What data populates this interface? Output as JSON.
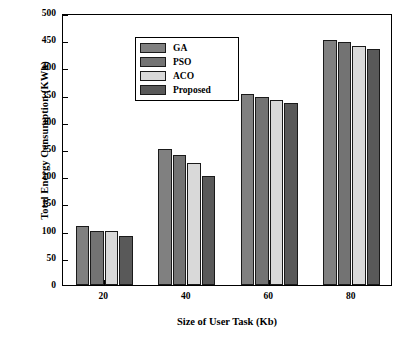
{
  "chart_data": {
    "type": "bar",
    "title": "",
    "xlabel": "Size of User Task (Kb)",
    "ylabel": "Total Energy Consumption (KWh)",
    "categories": [
      "20",
      "40",
      "60",
      "80"
    ],
    "series": [
      {
        "name": "GA",
        "color": "#808080",
        "values": [
          108,
          250,
          352,
          451
        ]
      },
      {
        "name": "PSO",
        "color": "#737373",
        "values": [
          100,
          239,
          345,
          446
        ]
      },
      {
        "name": "ACO",
        "color": "#d9d9d9",
        "values": [
          100,
          224,
          341,
          440
        ]
      },
      {
        "name": "Proposed",
        "color": "#595959",
        "values": [
          91,
          201,
          335,
          434
        ]
      }
    ],
    "ylim": [
      0,
      500
    ],
    "yticks": [
      0,
      50,
      100,
      150,
      200,
      250,
      300,
      350,
      400,
      450,
      500
    ],
    "ytick_labels": [
      "0",
      "50",
      "100",
      "150",
      "200",
      "250",
      "300",
      "350",
      "400",
      "450",
      "500"
    ],
    "xtick_labels": [
      "20",
      "40",
      "60",
      "80"
    ],
    "grid": false,
    "legend_position": "top-left",
    "legend_entries": [
      "GA",
      "PSO",
      "ACO",
      "Proposed"
    ]
  }
}
